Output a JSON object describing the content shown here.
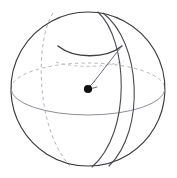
{
  "figure": {
    "kind": "geometry-diagram",
    "canvas": {
      "width": 177,
      "height": 178,
      "background": "#ffffff"
    },
    "colors": {
      "outline": "#3a3a3e",
      "meridian": "#4a4a50",
      "equator_front": "#8e8e96",
      "hidden_dashed": "#b4b4bc",
      "cap_arc": "#3f3f45",
      "arrow": "#6e6e78",
      "center_dot": "#111114"
    },
    "elements": {
      "sphere_outline": {
        "label": "sphere-outline",
        "cx": 88,
        "cy": 89,
        "r": 77,
        "path": "M 88 12 A 77 77 0 1 1 87.9 12 Z"
      },
      "equator_back": {
        "label": "equator-back-dashed",
        "path": "M 11 89 A 77 26 0 0 1 165 89"
      },
      "equator_front": {
        "label": "equator-front-solid",
        "path": "M 11 89 A 77 26 0 0 0 165 89"
      },
      "meridian_back_dashed": {
        "label": "meridian-back-dashed",
        "path": "M 53 13 C 36 38 34 126 70 166"
      },
      "meridian_front_a": {
        "label": "meridian-front-left",
        "path": "M 98 12 C 128 40 132 132 92 167"
      },
      "meridian_front_b": {
        "label": "meridian-front-right",
        "path": "M 103 13 C 141 42 146 130 109 166"
      },
      "cap_arc_front": {
        "label": "spherical-cap-front-arc",
        "path": "M 58 46 C 74 59 106 59 122 46"
      },
      "cap_arc_back": {
        "label": "spherical-cap-back-dashed",
        "path": "M 58 46 C 74 35 106 35 122 46"
      },
      "cap_circle_hidden": {
        "label": "cap-circle-hidden-dashed",
        "path": "M 56 62 C 74 68 104 68 124 61"
      },
      "radius_arrow": {
        "label": "radius-arrow",
        "from": [
          121,
          47
        ],
        "to": [
          93,
          83
        ],
        "path": "M 121 47 L 93 83",
        "head_path": "M 86 90 L 95 81 M 86 90 L 97 87"
      },
      "center_point": {
        "label": "sphere-center-point",
        "cx": 88,
        "cy": 89,
        "r": 4.1
      }
    }
  }
}
